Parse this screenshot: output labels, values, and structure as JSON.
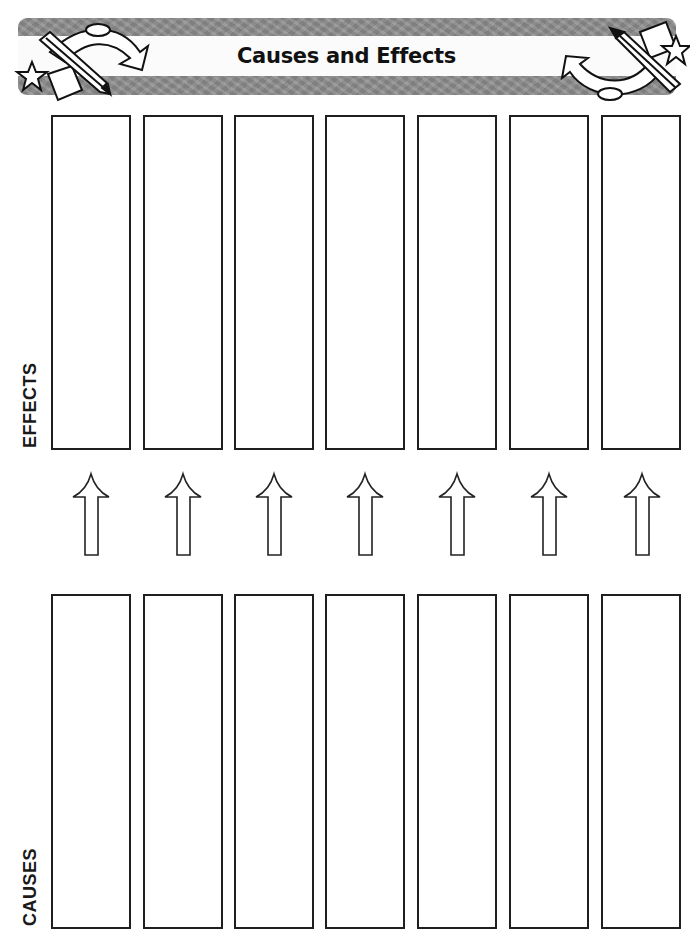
{
  "header": {
    "title": "Causes and Effects",
    "decorations": [
      "pencil-icon",
      "curved-arrow-icon",
      "star-icon",
      "paper-icon"
    ]
  },
  "sections": {
    "effects": {
      "label": "EFFECTS",
      "box_count": 7
    },
    "causes": {
      "label": "CAUSES",
      "box_count": 7
    }
  },
  "arrows": {
    "count": 7,
    "direction": "up",
    "icon": "up-arrow-icon"
  },
  "colors": {
    "banner_gray": "#8e8e8e",
    "box_border": "#1f1f1f",
    "text": "#111111"
  }
}
